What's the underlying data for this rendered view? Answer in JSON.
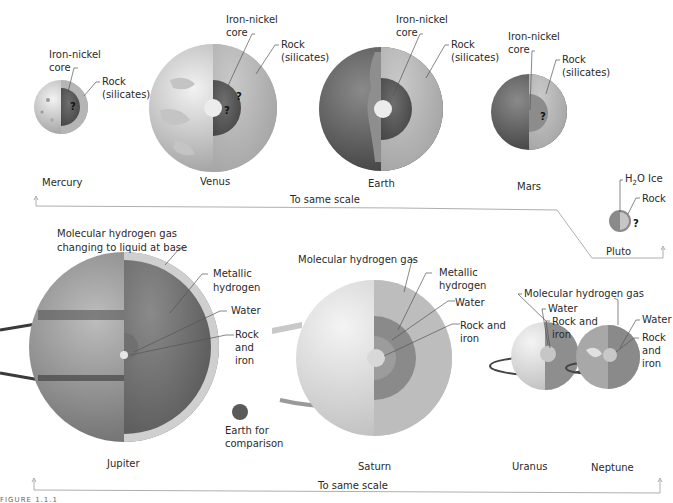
{
  "figure": {
    "caption": "FIGURE 1.1.1",
    "terrestrial_scale_label": "To same scale",
    "jovian_scale_label": "To same scale"
  },
  "terrestrial_planets": [
    {
      "name": "Mercury",
      "labels": [
        "Iron-nickel",
        "core",
        "Rock",
        "(silicates)"
      ],
      "unknown_marks": [
        "?"
      ]
    },
    {
      "name": "Venus",
      "labels": [
        "Iron-nickel",
        "core",
        "Rock",
        "(silicates)"
      ],
      "unknown_marks": [
        "?",
        "?"
      ]
    },
    {
      "name": "Earth",
      "labels": [
        "Iron-nickel",
        "core",
        "Rock",
        "(silicates)"
      ]
    },
    {
      "name": "Mars",
      "labels": [
        "Iron-nickel",
        "core",
        "Rock",
        "(silicates)"
      ],
      "unknown_marks": [
        "?"
      ]
    },
    {
      "name": "Pluto",
      "labels": [
        "H",
        "2",
        "O Ice",
        "Rock"
      ],
      "unknown_marks": [
        "?"
      ]
    }
  ],
  "jovian_planets": [
    {
      "name": "Jupiter",
      "labels": [
        "Molecular hydrogen gas",
        "changing to liquid at base",
        "Metallic",
        "hydrogen",
        "Water",
        "Rock",
        "and",
        "iron"
      ]
    },
    {
      "name": "Saturn",
      "labels": [
        "Molecular hydrogen gas",
        "Metallic",
        "hydrogen",
        "Water",
        "Rock and",
        "iron"
      ]
    },
    {
      "name": "Uranus",
      "labels": [
        "Molecular hydrogen gas",
        "Water",
        "Rock and",
        "iron"
      ]
    },
    {
      "name": "Neptune",
      "labels": [
        "Water",
        "Rock",
        "and",
        "iron"
      ]
    }
  ],
  "comparison": {
    "labels": [
      "Earth for",
      "comparison"
    ]
  },
  "colors": {
    "rock_mantle": "#b8b8b8",
    "core_dark": "#5e5e5e",
    "inner_core": "#e8e8e8",
    "surface_light": "#d4d4d4",
    "metallic_hydrogen": "#7c7c7c",
    "bracket": "#999999"
  }
}
